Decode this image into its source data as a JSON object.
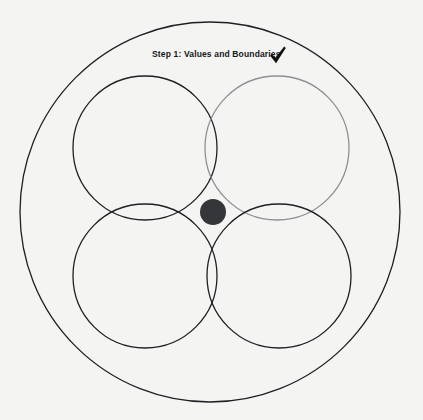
{
  "canvas": {
    "width": 423,
    "height": 420,
    "background_color": "#f4f4f2"
  },
  "annotation": {
    "step_label": "Step 1: Values and Boundaries",
    "check_icon_name": "check-mark-icon",
    "label_color": "#16181a",
    "check_color": "#111111"
  },
  "chart_data": {
    "type": "diagram",
    "subtype": "venn-rosette",
    "title": "Step 1: Values and Boundaries",
    "background": "#f4f4f2",
    "center": {
      "x": 212,
      "y": 212
    },
    "outer_circle": {
      "name": "boundary-circle",
      "cx": 210,
      "cy": 212,
      "r": 190,
      "stroke": "#1d1f22",
      "stroke_width": 1.3,
      "fill": "none"
    },
    "petal_circles": [
      {
        "name": "circle-top-left",
        "cx": 145,
        "cy": 148,
        "r": 72,
        "stroke": "#1d1f22",
        "stroke_width": 1.3,
        "fill": "none"
      },
      {
        "name": "circle-top-right",
        "cx": 277,
        "cy": 148,
        "r": 72,
        "stroke": "#8d9094",
        "stroke_width": 1.3,
        "fill": "none"
      },
      {
        "name": "circle-bottom-left",
        "cx": 145,
        "cy": 276,
        "r": 72,
        "stroke": "#1d1f22",
        "stroke_width": 1.3,
        "fill": "none"
      },
      {
        "name": "circle-bottom-right",
        "cx": 279,
        "cy": 276,
        "r": 72,
        "stroke": "#1d1f22",
        "stroke_width": 1.3,
        "fill": "none"
      }
    ],
    "center_dot": {
      "name": "core-dot",
      "cx": 213,
      "cy": 212,
      "r": 13,
      "fill": "#35363a"
    }
  }
}
